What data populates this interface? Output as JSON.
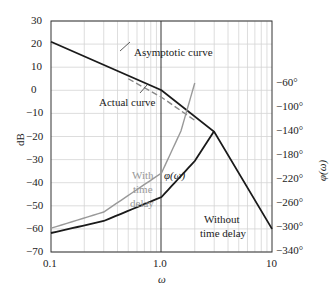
{
  "chart_data": {
    "type": "line",
    "title": "",
    "xlabel": "ω",
    "ylabel": "dB",
    "ylabel_right": "φ(ω)",
    "xscale": "log",
    "xlim": [
      0.1,
      10
    ],
    "ylim": [
      -70,
      30
    ],
    "ylim_right": [
      -340,
      -60
    ],
    "x_ticks": [
      "0.1",
      "1.0",
      "10"
    ],
    "y_ticks": [
      "30",
      "20",
      "10",
      "0",
      "−10",
      "−20",
      "−30",
      "−40",
      "−50",
      "−60",
      "−70"
    ],
    "y_ticks_right": [
      "−60°",
      "−100°",
      "−140°",
      "−180°",
      "−220°",
      "−260°",
      "−300°",
      "−340°"
    ],
    "grid": true,
    "series": [
      {
        "name": "Asymptotic curve",
        "axis": "left",
        "style": "solid",
        "color": "#1a1a1a",
        "x": [
          0.1,
          1.0,
          3.0,
          10
        ],
        "y": [
          21,
          0,
          -18,
          -60
        ]
      },
      {
        "name": "Actual curve",
        "axis": "left",
        "style": "dashed",
        "color": "#888888",
        "x": [
          0.5,
          1.0,
          2.0
        ],
        "y": [
          5,
          -3,
          -13
        ]
      },
      {
        "name": "φ(ω) Without time delay",
        "axis": "right",
        "style": "solid",
        "color": "#1a1a1a",
        "x": [
          0.1,
          0.3,
          1.0,
          2.0,
          3.0
        ],
        "y": [
          -90,
          -110,
          -150,
          -210,
          -260
        ]
      },
      {
        "name": "φ(ω) With time delay",
        "axis": "right",
        "style": "solid",
        "color": "#999999",
        "x": [
          0.1,
          0.3,
          1.0,
          1.5,
          2.0
        ],
        "y": [
          -98,
          -125,
          -190,
          -260,
          -340
        ]
      }
    ],
    "annotations": [
      "Asymptotic curve",
      "Actual curve",
      "φ(ω)",
      "With time delay",
      "Without time delay"
    ]
  },
  "labels": {
    "y_axis": "dB",
    "y_axis_right": "φ(ω)",
    "x_axis": "ω",
    "asymptotic": "Asymptotic curve",
    "actual": "Actual curve",
    "phi": "φ(ω)",
    "with1": "With",
    "with2": "time",
    "with3": "delay",
    "without1": "Without",
    "without2": "time delay"
  }
}
